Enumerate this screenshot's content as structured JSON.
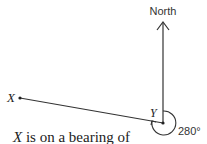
{
  "diagram": {
    "north_label": "North",
    "point_x_label": "X",
    "point_y_label": "Y",
    "angle_label": "280°",
    "caption_var": "X",
    "caption_text": " is on a bearing of"
  }
}
